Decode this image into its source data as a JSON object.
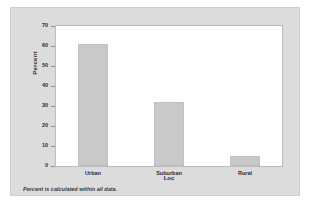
{
  "chart_data": {
    "type": "bar",
    "title": "",
    "categories": [
      "Urban",
      "Suburban",
      "Rural"
    ],
    "values": [
      61,
      32,
      5
    ],
    "xlabel": "Loc",
    "ylabel": "Percent",
    "ylim": [
      0,
      70
    ],
    "yticks": [
      70,
      60,
      50,
      40,
      30,
      20,
      10,
      0
    ],
    "grid": false,
    "legend": null,
    "bar_color": "#c9c9c9",
    "annotations": [
      "Percent is calculated within all data."
    ]
  },
  "figure": {
    "panel_color": "#dcdcdc",
    "plot_background": "#ffffff",
    "footnote": "Percent is calculated within all data."
  }
}
